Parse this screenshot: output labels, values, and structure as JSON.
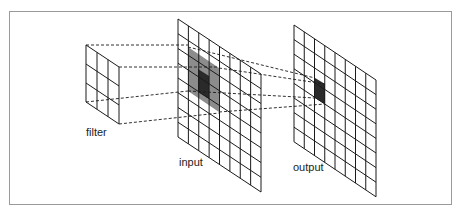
{
  "diagram": {
    "type": "convolution-illustration",
    "labels": {
      "filter": "filter",
      "input": "input",
      "output": "output"
    },
    "filter": {
      "rows": 3,
      "cols": 3
    },
    "input": {
      "rows": 8,
      "cols": 8,
      "receptive_field": {
        "rows": 3,
        "cols": 3
      },
      "center_cell_highlight": true
    },
    "output": {
      "rows": 8,
      "cols": 8,
      "highlighted_cell": {
        "row": 3,
        "col": 2
      }
    },
    "colors": {
      "grid_line": "#1a1a1a",
      "receptive_field_fill": "#8c8c8c",
      "center_cell_fill": "#2a2a2a",
      "output_cell_fill": "#2a2a2a",
      "frame_border": "#9a9a9a"
    }
  }
}
